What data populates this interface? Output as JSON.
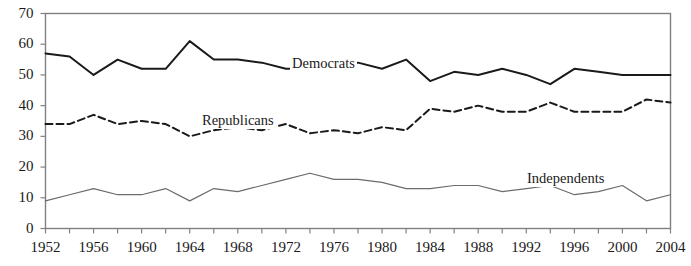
{
  "chart_data": {
    "type": "line",
    "title": "",
    "subtitle": "",
    "xlabel": "",
    "ylabel": "",
    "xlim": [
      1952,
      2004
    ],
    "ylim": [
      0,
      70
    ],
    "ytick_values": [
      0,
      10,
      20,
      30,
      40,
      50,
      60,
      70
    ],
    "ytick_labels": [
      "0",
      "10",
      "20",
      "30",
      "40",
      "50",
      "60",
      "70"
    ],
    "xtick_labels": [
      "1952",
      "1956",
      "1960",
      "1964",
      "1968",
      "1972",
      "1976",
      "1980",
      "1984",
      "1988",
      "1992",
      "1996",
      "2000",
      "2004"
    ],
    "xtick_values": [
      1952,
      1956,
      1960,
      1964,
      1968,
      1972,
      1976,
      1980,
      1984,
      1988,
      1992,
      1996,
      2000,
      2004
    ],
    "minor_xtick_interval": 2,
    "grid": false,
    "legend_position": "inline-annotations",
    "x": [
      1952,
      1954,
      1956,
      1958,
      1960,
      1962,
      1964,
      1966,
      1968,
      1970,
      1972,
      1974,
      1976,
      1978,
      1980,
      1982,
      1984,
      1986,
      1988,
      1990,
      1992,
      1994,
      1996,
      1998,
      2000,
      2002,
      2004
    ],
    "series": [
      {
        "name": "Democrats",
        "style": "solid",
        "color": "#1a1a1a",
        "width": 2.0,
        "values": [
          57,
          56,
          50,
          55,
          52,
          52,
          61,
          55,
          55,
          54,
          52,
          52,
          52,
          54,
          52,
          55,
          48,
          51,
          50,
          52,
          50,
          47,
          52,
          51,
          50,
          50,
          50
        ],
        "label_position": {
          "x": 290,
          "y": 55
        }
      },
      {
        "name": "Republicans",
        "style": "dashed",
        "color": "#1a1a1a",
        "width": 2.0,
        "values": [
          34,
          34,
          37,
          34,
          35,
          34,
          30,
          32,
          33,
          32,
          34,
          31,
          32,
          31,
          33,
          32,
          39,
          38,
          40,
          38,
          38,
          41,
          38,
          38,
          38,
          42,
          41
        ],
        "label_position": {
          "x": 200,
          "y": 112
        }
      },
      {
        "name": "Independents",
        "style": "solid",
        "color": "#6b6b6b",
        "width": 1.2,
        "values": [
          9,
          11,
          13,
          11,
          11,
          13,
          9,
          13,
          12,
          14,
          16,
          18,
          16,
          16,
          15,
          13,
          13,
          14,
          14,
          12,
          13,
          14,
          11,
          12,
          14,
          9,
          11
        ],
        "label_position": {
          "x": 525,
          "y": 170
        }
      }
    ]
  },
  "axes": {
    "frame_color": "#808080",
    "tick_color": "#808080"
  }
}
